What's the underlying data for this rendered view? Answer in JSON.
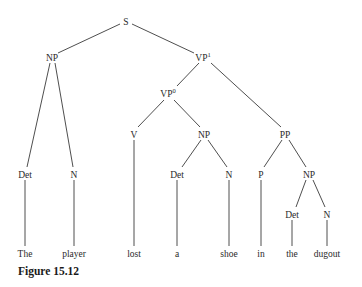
{
  "figure": {
    "caption": "Figure 15.12"
  },
  "tree": {
    "nodes": [
      {
        "id": "S",
        "label": "S",
        "sup": "",
        "x": 126,
        "y": 22
      },
      {
        "id": "NP1",
        "label": "NP",
        "sup": "",
        "x": 52,
        "y": 58
      },
      {
        "id": "VP1",
        "label": "VP",
        "sup": "1",
        "x": 203,
        "y": 58
      },
      {
        "id": "VP0",
        "label": "VP",
        "sup": "0",
        "x": 168,
        "y": 94
      },
      {
        "id": "V",
        "label": "V",
        "sup": "",
        "x": 134,
        "y": 135
      },
      {
        "id": "NP2",
        "label": "NP",
        "sup": "",
        "x": 204,
        "y": 135
      },
      {
        "id": "PP",
        "label": "PP",
        "sup": "",
        "x": 285,
        "y": 135
      },
      {
        "id": "Det1",
        "label": "Det",
        "sup": "",
        "x": 25,
        "y": 175
      },
      {
        "id": "N1",
        "label": "N",
        "sup": "",
        "x": 74,
        "y": 175
      },
      {
        "id": "Det2",
        "label": "Det",
        "sup": "",
        "x": 177,
        "y": 175
      },
      {
        "id": "N2",
        "label": "N",
        "sup": "",
        "x": 229,
        "y": 175
      },
      {
        "id": "P",
        "label": "P",
        "sup": "",
        "x": 261,
        "y": 175
      },
      {
        "id": "NP3",
        "label": "NP",
        "sup": "",
        "x": 309,
        "y": 175
      },
      {
        "id": "Det3",
        "label": "Det",
        "sup": "",
        "x": 291,
        "y": 215
      },
      {
        "id": "N3",
        "label": "N",
        "sup": "",
        "x": 327,
        "y": 215
      }
    ],
    "words": [
      {
        "text": "The",
        "x": 25
      },
      {
        "text": "player",
        "x": 74
      },
      {
        "text": "lost",
        "x": 134
      },
      {
        "text": "a",
        "x": 177
      },
      {
        "text": "shoe",
        "x": 229
      },
      {
        "text": "in",
        "x": 261
      },
      {
        "text": "the",
        "x": 291
      },
      {
        "text": "dugout",
        "x": 327
      }
    ],
    "words_y": 256
  }
}
